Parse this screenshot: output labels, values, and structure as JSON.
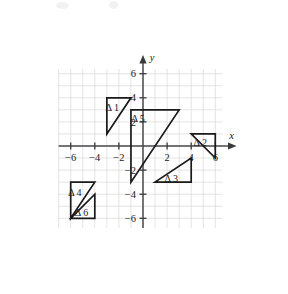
{
  "figure": {
    "title": "",
    "x_axis_label": "x",
    "y_axis_label": "y"
  },
  "chart_data": {
    "type": "scatter",
    "title": "",
    "xlabel": "x",
    "ylabel": "y",
    "xlim": [
      -7,
      6.6
    ],
    "ylim": [
      -6.8,
      6.4
    ],
    "grid": true,
    "grid_step": 1,
    "legend": "none",
    "x_ticks": [
      -6,
      -4,
      -2,
      2,
      4,
      6
    ],
    "y_ticks": [
      6,
      4,
      2,
      -2,
      -4,
      -6
    ],
    "x_tick_labels": [
      "-6",
      "-4",
      "-2",
      "2",
      "4",
      "6"
    ],
    "y_tick_labels": [
      "6",
      "4",
      "2",
      "-2",
      "-4",
      "-6"
    ],
    "shapes": [
      {
        "name": "triangle-1",
        "label": "Δ 1",
        "label_x": -2.55,
        "label_y": 3.15,
        "vertices": [
          [
            -3,
            4
          ],
          [
            -1,
            4
          ],
          [
            -3,
            1
          ]
        ]
      },
      {
        "name": "triangle-2",
        "label": "Δ 2",
        "label_x": 4.75,
        "label_y": 0.25,
        "vertices": [
          [
            4,
            1
          ],
          [
            6,
            1
          ],
          [
            6,
            -1
          ]
        ]
      },
      {
        "name": "triangle-3",
        "label": "Δ 3",
        "label_x": 2.35,
        "label_y": -2.7,
        "vertices": [
          [
            1,
            -3
          ],
          [
            4,
            -3
          ],
          [
            4,
            -1
          ]
        ]
      },
      {
        "name": "triangle-4",
        "label": "Δ 4",
        "label_x": -5.65,
        "label_y": -3.85,
        "vertices": [
          [
            -6,
            -3
          ],
          [
            -4,
            -3
          ],
          [
            -6,
            -6
          ]
        ]
      },
      {
        "name": "triangle-5",
        "label": "Δ 5",
        "label_x": -0.4,
        "label_y": 2.3,
        "vertices": [
          [
            -1,
            3
          ],
          [
            3,
            3
          ],
          [
            -1,
            -3
          ]
        ]
      },
      {
        "name": "triangle-6",
        "label": "Δ 6",
        "label_x": -5.1,
        "label_y": -5.5,
        "vertices": [
          [
            -6,
            -6
          ],
          [
            -4,
            -4
          ],
          [
            -4,
            -6
          ]
        ]
      }
    ]
  },
  "colors": {
    "background": "#ffffff",
    "grid": "#d9d9dc",
    "axis": "#4a4a4f",
    "shape_stroke": "#1a1a1a",
    "text": "#1a1a1a"
  }
}
